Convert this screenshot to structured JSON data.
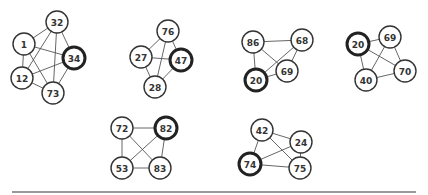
{
  "graphs": [
    {
      "id": "graph-1",
      "nodes": [
        {
          "label": "32",
          "x": 57,
          "y": 22,
          "highlight": false
        },
        {
          "label": "1",
          "x": 24,
          "y": 44,
          "highlight": false
        },
        {
          "label": "34",
          "x": 74,
          "y": 58,
          "highlight": true
        },
        {
          "label": "12",
          "x": 22,
          "y": 78,
          "highlight": false
        },
        {
          "label": "73",
          "x": 53,
          "y": 93,
          "highlight": false
        }
      ],
      "edges": [
        [
          "1",
          "32"
        ],
        [
          "1",
          "34"
        ],
        [
          "1",
          "12"
        ],
        [
          "1",
          "73"
        ],
        [
          "32",
          "12"
        ],
        [
          "32",
          "73"
        ],
        [
          "32",
          "34"
        ],
        [
          "34",
          "12"
        ],
        [
          "34",
          "73"
        ],
        [
          "12",
          "73"
        ]
      ]
    },
    {
      "id": "graph-2",
      "nodes": [
        {
          "label": "76",
          "x": 168,
          "y": 31,
          "highlight": false
        },
        {
          "label": "27",
          "x": 141,
          "y": 57,
          "highlight": false
        },
        {
          "label": "47",
          "x": 181,
          "y": 60,
          "highlight": true
        },
        {
          "label": "28",
          "x": 155,
          "y": 87,
          "highlight": false
        }
      ],
      "edges": [
        [
          "76",
          "27"
        ],
        [
          "76",
          "47"
        ],
        [
          "76",
          "28"
        ],
        [
          "27",
          "47"
        ],
        [
          "27",
          "28"
        ],
        [
          "47",
          "28"
        ]
      ]
    },
    {
      "id": "graph-3",
      "nodes": [
        {
          "label": "86",
          "x": 253,
          "y": 42,
          "highlight": false
        },
        {
          "label": "68",
          "x": 302,
          "y": 40,
          "highlight": false
        },
        {
          "label": "69",
          "x": 287,
          "y": 71,
          "highlight": false
        },
        {
          "label": "20",
          "x": 256,
          "y": 80,
          "highlight": true
        }
      ],
      "edges": [
        [
          "86",
          "68"
        ],
        [
          "86",
          "69"
        ],
        [
          "86",
          "20"
        ],
        [
          "68",
          "20"
        ],
        [
          "68",
          "69"
        ],
        [
          "20",
          "69"
        ]
      ]
    },
    {
      "id": "graph-4",
      "nodes": [
        {
          "label": "20",
          "x": 358,
          "y": 44,
          "highlight": true
        },
        {
          "label": "69",
          "x": 390,
          "y": 37,
          "highlight": false
        },
        {
          "label": "40",
          "x": 366,
          "y": 80,
          "highlight": false
        },
        {
          "label": "70",
          "x": 405,
          "y": 71,
          "highlight": false
        }
      ],
      "edges": [
        [
          "20",
          "69"
        ],
        [
          "20",
          "40"
        ],
        [
          "20",
          "70"
        ],
        [
          "69",
          "40"
        ],
        [
          "69",
          "70"
        ],
        [
          "40",
          "70"
        ]
      ]
    },
    {
      "id": "graph-5",
      "nodes": [
        {
          "label": "72",
          "x": 122,
          "y": 128,
          "highlight": false
        },
        {
          "label": "82",
          "x": 166,
          "y": 128,
          "highlight": true
        },
        {
          "label": "53",
          "x": 122,
          "y": 168,
          "highlight": false
        },
        {
          "label": "83",
          "x": 160,
          "y": 168,
          "highlight": false
        }
      ],
      "edges": [
        [
          "72",
          "82"
        ],
        [
          "72",
          "53"
        ],
        [
          "72",
          "83"
        ],
        [
          "82",
          "53"
        ],
        [
          "82",
          "83"
        ],
        [
          "53",
          "83"
        ]
      ]
    },
    {
      "id": "graph-6",
      "nodes": [
        {
          "label": "42",
          "x": 262,
          "y": 130,
          "highlight": false
        },
        {
          "label": "24",
          "x": 301,
          "y": 142,
          "highlight": false
        },
        {
          "label": "74",
          "x": 250,
          "y": 164,
          "highlight": true
        },
        {
          "label": "75",
          "x": 300,
          "y": 168,
          "highlight": false
        }
      ],
      "edges": [
        [
          "42",
          "24"
        ],
        [
          "42",
          "74"
        ],
        [
          "42",
          "75"
        ],
        [
          "24",
          "74"
        ],
        [
          "24",
          "75"
        ],
        [
          "74",
          "75"
        ]
      ]
    }
  ],
  "style": {
    "node_radius": 11,
    "edge_color": "#555555",
    "node_stroke": "#333333",
    "highlight_stroke": "#222222",
    "rule": {
      "x1": 12,
      "x2": 416,
      "y": 192
    }
  }
}
